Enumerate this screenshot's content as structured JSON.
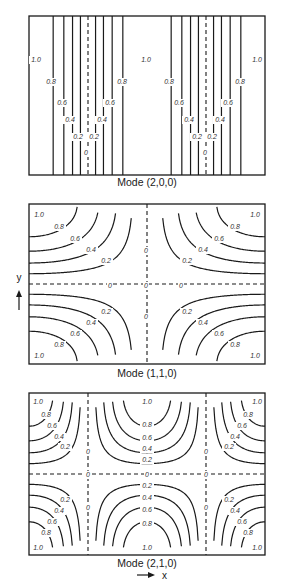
{
  "figure": {
    "background": "#ffffff",
    "line_color": "#1a1a1a",
    "contour_levels": [
      "1.0",
      "0.8",
      "0.6",
      "0.4",
      "0.2",
      "0"
    ],
    "panels": [
      {
        "id": "mode-200",
        "caption": "Mode (2,0,0)",
        "mode": [
          2,
          0,
          0
        ],
        "box": {
          "x": 29,
          "y": 16,
          "w": 236,
          "h": 159
        },
        "caption_y": 186,
        "labels": [
          {
            "t": "1.0",
            "x": 36,
            "y": 62
          },
          {
            "t": "1.0",
            "x": 146,
            "y": 62
          },
          {
            "t": "1.0",
            "x": 257,
            "y": 62
          },
          {
            "t": "0.8",
            "x": 51,
            "y": 84
          },
          {
            "t": "0.8",
            "x": 122,
            "y": 84
          },
          {
            "t": "0.8",
            "x": 169,
            "y": 84
          },
          {
            "t": "0.8",
            "x": 240,
            "y": 84
          },
          {
            "t": "0.6",
            "x": 62,
            "y": 105
          },
          {
            "t": "0.6",
            "x": 110,
            "y": 105
          },
          {
            "t": "0.6",
            "x": 179,
            "y": 105
          },
          {
            "t": "0.6",
            "x": 228,
            "y": 105
          },
          {
            "t": "0.4",
            "x": 70,
            "y": 122
          },
          {
            "t": "0.4",
            "x": 102,
            "y": 122
          },
          {
            "t": "0.4",
            "x": 189,
            "y": 122
          },
          {
            "t": "0.4",
            "x": 220,
            "y": 122
          },
          {
            "t": "0.2",
            "x": 78,
            "y": 139
          },
          {
            "t": "0.2",
            "x": 94,
            "y": 139
          },
          {
            "t": "0.2",
            "x": 197,
            "y": 139
          },
          {
            "t": "0.2",
            "x": 212,
            "y": 139
          },
          {
            "t": "0",
            "x": 86,
            "y": 155
          },
          {
            "t": "0",
            "x": 205,
            "y": 155
          }
        ]
      },
      {
        "id": "mode-110",
        "caption": "Mode (1,1,0)",
        "mode": [
          1,
          1,
          0
        ],
        "box": {
          "x": 29,
          "y": 204,
          "w": 236,
          "h": 160
        },
        "caption_y": 377,
        "labels": [
          {
            "t": "1.0",
            "x": 39,
            "y": 217
          },
          {
            "t": "1.0",
            "x": 255,
            "y": 217
          },
          {
            "t": "1.0",
            "x": 39,
            "y": 358
          },
          {
            "t": "1.0",
            "x": 255,
            "y": 358
          },
          {
            "t": "0.8",
            "x": 59,
            "y": 229
          },
          {
            "t": "0.6",
            "x": 75,
            "y": 241
          },
          {
            "t": "0.4",
            "x": 91,
            "y": 252
          },
          {
            "t": "0.2",
            "x": 106,
            "y": 263
          },
          {
            "t": "0.8",
            "x": 235,
            "y": 229
          },
          {
            "t": "0.6",
            "x": 219,
            "y": 241
          },
          {
            "t": "0.4",
            "x": 203,
            "y": 252
          },
          {
            "t": "0.2",
            "x": 187,
            "y": 263
          },
          {
            "t": "0.2",
            "x": 106,
            "y": 314
          },
          {
            "t": "0.4",
            "x": 91,
            "y": 325
          },
          {
            "t": "0.6",
            "x": 75,
            "y": 336
          },
          {
            "t": "0.8",
            "x": 59,
            "y": 347
          },
          {
            "t": "0.2",
            "x": 187,
            "y": 314
          },
          {
            "t": "0.4",
            "x": 203,
            "y": 325
          },
          {
            "t": "0.6",
            "x": 219,
            "y": 336
          },
          {
            "t": "0.8",
            "x": 235,
            "y": 347
          },
          {
            "t": "0",
            "x": 146,
            "y": 253
          },
          {
            "t": "0",
            "x": 146,
            "y": 319
          },
          {
            "t": "0",
            "x": 110,
            "y": 288
          },
          {
            "t": "0",
            "x": 146,
            "y": 288
          },
          {
            "t": "0",
            "x": 181,
            "y": 288
          }
        ]
      },
      {
        "id": "mode-210",
        "caption": "Mode (2,1,0)",
        "mode": [
          2,
          1,
          0
        ],
        "box": {
          "x": 29,
          "y": 393,
          "w": 236,
          "h": 162
        },
        "caption_y": 567,
        "labels": [
          {
            "t": "1.0",
            "x": 38,
            "y": 404
          },
          {
            "t": "1.0",
            "x": 147,
            "y": 404
          },
          {
            "t": "1.0",
            "x": 257,
            "y": 404
          },
          {
            "t": "0.8",
            "x": 46,
            "y": 417
          },
          {
            "t": "0.6",
            "x": 52,
            "y": 428
          },
          {
            "t": "0.4",
            "x": 59,
            "y": 439
          },
          {
            "t": "0.2",
            "x": 65,
            "y": 449
          },
          {
            "t": "0.8",
            "x": 248,
            "y": 417
          },
          {
            "t": "0.6",
            "x": 242,
            "y": 428
          },
          {
            "t": "0.4",
            "x": 235,
            "y": 439
          },
          {
            "t": "0.2",
            "x": 229,
            "y": 449
          },
          {
            "t": "0.8",
            "x": 147,
            "y": 427
          },
          {
            "t": "0.6",
            "x": 147,
            "y": 440
          },
          {
            "t": "0.4",
            "x": 147,
            "y": 451
          },
          {
            "t": "0.2",
            "x": 147,
            "y": 462
          },
          {
            "t": "0",
            "x": 88,
            "y": 454
          },
          {
            "t": "0",
            "x": 206,
            "y": 454
          },
          {
            "t": "0",
            "x": 88,
            "y": 477
          },
          {
            "t": "0",
            "x": 147,
            "y": 477
          },
          {
            "t": "0",
            "x": 206,
            "y": 477
          },
          {
            "t": "0",
            "x": 88,
            "y": 510
          },
          {
            "t": "0",
            "x": 206,
            "y": 510
          },
          {
            "t": "0.2",
            "x": 147,
            "y": 488
          },
          {
            "t": "0.4",
            "x": 147,
            "y": 500
          },
          {
            "t": "0.6",
            "x": 147,
            "y": 512
          },
          {
            "t": "0.8",
            "x": 147,
            "y": 526
          },
          {
            "t": "0.2",
            "x": 65,
            "y": 502
          },
          {
            "t": "0.4",
            "x": 59,
            "y": 513
          },
          {
            "t": "0.6",
            "x": 52,
            "y": 524
          },
          {
            "t": "0.8",
            "x": 46,
            "y": 535
          },
          {
            "t": "0.2",
            "x": 229,
            "y": 502
          },
          {
            "t": "0.4",
            "x": 235,
            "y": 513
          },
          {
            "t": "0.6",
            "x": 242,
            "y": 524
          },
          {
            "t": "0.8",
            "x": 248,
            "y": 535
          },
          {
            "t": "1.0",
            "x": 38,
            "y": 550
          },
          {
            "t": "1.0",
            "x": 147,
            "y": 550
          },
          {
            "t": "1.0",
            "x": 257,
            "y": 550
          }
        ]
      }
    ],
    "axes": {
      "y_label": "y",
      "x_label": "x",
      "y_arrow": {
        "x": 19,
        "label_y": 281,
        "y1": 310,
        "y2": 290
      },
      "x_arrow": {
        "x1": 137,
        "x2": 155,
        "y": 575,
        "label_x": 162
      }
    }
  }
}
